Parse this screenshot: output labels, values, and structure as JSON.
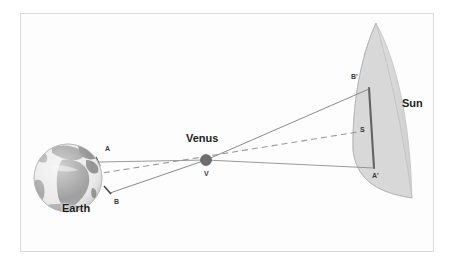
{
  "figure": {
    "background_color": "#ffffff",
    "frame_color": "#dcdcdc",
    "line_color": "#8c8c8c",
    "accent_color": "#6a6a6a",
    "sun_fill": "#d6d6d6",
    "sun_stroke": "#b9b9b9",
    "earth_ocean": "#e9e9e9",
    "earth_land": "#9b9b9b",
    "chord_color": "#5a5a5a"
  },
  "bodies": {
    "earth": {
      "label": "Earth",
      "cx": 68,
      "cy": 178,
      "r": 34
    },
    "venus": {
      "label": "Venus",
      "point_label": "V",
      "cx": 206,
      "cy": 160,
      "r": 5.5
    },
    "sun": {
      "label": "Sun"
    }
  },
  "points": [
    {
      "id": "A",
      "label": "A",
      "x": 105,
      "y": 152,
      "role": "earth-north-observer"
    },
    {
      "id": "B",
      "label": "B",
      "x": 113,
      "y": 200,
      "role": "earth-south-observer"
    },
    {
      "id": "V",
      "label": "V",
      "x": 204,
      "y": 172,
      "role": "venus-center"
    },
    {
      "id": "Bp",
      "label": "B'",
      "x": 352,
      "y": 76,
      "role": "sun-projection-of-B"
    },
    {
      "id": "S",
      "label": "S",
      "x": 360,
      "y": 129,
      "role": "sun-center"
    },
    {
      "id": "Ap",
      "label": "A'",
      "x": 373,
      "y": 176,
      "role": "sun-projection-of-A"
    }
  ],
  "sight_lines": [
    {
      "from": "A",
      "to": "Ap",
      "style": "solid",
      "desc": "line of sight from northern observer A through Venus to A-prime on the Sun"
    },
    {
      "from": "B",
      "to": "Bp",
      "style": "solid",
      "desc": "line of sight from southern observer B through Venus to B-prime on the Sun"
    },
    {
      "from": "E",
      "to": "S",
      "style": "dashed",
      "desc": "Earth-Sun centre axis passing near Venus"
    }
  ],
  "annotations": {
    "earth_label": "Earth",
    "venus_label": "Venus",
    "sun_label": "Sun"
  }
}
